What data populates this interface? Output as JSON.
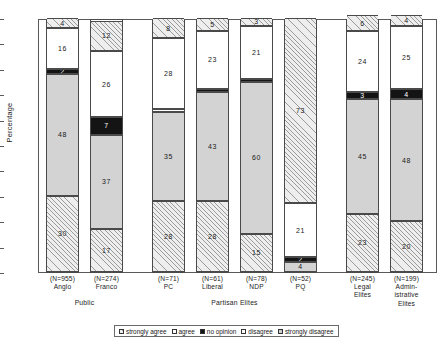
{
  "chart_data": {
    "type": "bar",
    "subtype": "stacked-bar-100-percent",
    "title": "",
    "xlabel": "",
    "ylabel": "Percentage",
    "ylim": [
      0,
      100
    ],
    "yticks": [
      0,
      10,
      20,
      30,
      40,
      50,
      60,
      70,
      80,
      90,
      100
    ],
    "grid": false,
    "legend_position": "bottom",
    "legend": [
      {
        "label": "strongly agree",
        "pattern": "hatch"
      },
      {
        "label": "agree",
        "pattern": "white"
      },
      {
        "label": "no opinion",
        "pattern": "black"
      },
      {
        "label": "disagree",
        "pattern": "white"
      },
      {
        "label": "strongly disagree",
        "pattern": "hatch-gray"
      }
    ],
    "categories": [
      "(N=955) Anglo",
      "(N=274) Franco",
      "(N=71) PC",
      "(N=61) Liberal",
      "(N=78) NDP",
      "(N=52) PQ",
      "(N=245) Legal Elites",
      "(N=199) Administrative Elites"
    ],
    "series": [
      {
        "name": "strongly agree",
        "values": [
          30,
          17,
          28,
          28,
          15,
          4,
          23,
          20
        ]
      },
      {
        "name": "agree",
        "values": [
          48,
          37,
          35,
          43,
          60,
          2,
          45,
          48
        ]
      },
      {
        "name": "no opinion",
        "values": [
          2,
          7,
          0,
          1,
          1,
          21,
          3,
          4
        ]
      },
      {
        "name": "disagree",
        "values": [
          16,
          26,
          28,
          23,
          21,
          73,
          24,
          25
        ]
      },
      {
        "name": "strongly disagree",
        "values": [
          4,
          12,
          8,
          5,
          3,
          0,
          6,
          4
        ]
      }
    ],
    "bars": [
      {
        "key": "anglo",
        "n_label": "(N=955)",
        "name_lines": [
          "Anglo"
        ],
        "segments": [
          {
            "label": "30",
            "value": 30,
            "pattern": "hatch"
          },
          {
            "label": "48",
            "value": 48,
            "pattern": "gray"
          },
          {
            "label": "2",
            "value": 2,
            "pattern": "black"
          },
          {
            "label": "16",
            "value": 16,
            "pattern": "white"
          },
          {
            "label": "4",
            "value": 4,
            "pattern": "hatch"
          }
        ]
      },
      {
        "key": "franco",
        "n_label": "(N=274)",
        "name_lines": [
          "Franco"
        ],
        "segments": [
          {
            "label": "17",
            "value": 17,
            "pattern": "hatch"
          },
          {
            "label": "37",
            "value": 37,
            "pattern": "gray"
          },
          {
            "label": "7",
            "value": 7,
            "pattern": "black"
          },
          {
            "label": "26",
            "value": 26,
            "pattern": "white"
          },
          {
            "label": "12",
            "value": 12,
            "pattern": "hatch"
          }
        ]
      },
      {
        "key": "pc",
        "n_label": "(N=71)",
        "name_lines": [
          "PC"
        ],
        "segments": [
          {
            "label": "28",
            "value": 28,
            "pattern": "hatch"
          },
          {
            "label": "35",
            "value": 35,
            "pattern": "gray"
          },
          {
            "label": "",
            "value": 1,
            "pattern": "white"
          },
          {
            "label": "28",
            "value": 28,
            "pattern": "white"
          },
          {
            "label": "8",
            "value": 8,
            "pattern": "hatch"
          }
        ]
      },
      {
        "key": "liberal",
        "n_label": "(N=61)",
        "name_lines": [
          "Liberal"
        ],
        "segments": [
          {
            "label": "28",
            "value": 28,
            "pattern": "hatch"
          },
          {
            "label": "43",
            "value": 43,
            "pattern": "gray"
          },
          {
            "label": "",
            "value": 1,
            "pattern": "black"
          },
          {
            "label": "23",
            "value": 23,
            "pattern": "white"
          },
          {
            "label": "5",
            "value": 5,
            "pattern": "hatch"
          }
        ]
      },
      {
        "key": "ndp",
        "n_label": "(N=78)",
        "name_lines": [
          "NDP"
        ],
        "segments": [
          {
            "label": "15",
            "value": 15,
            "pattern": "hatch"
          },
          {
            "label": "60",
            "value": 60,
            "pattern": "gray"
          },
          {
            "label": "",
            "value": 1,
            "pattern": "black"
          },
          {
            "label": "21",
            "value": 21,
            "pattern": "white"
          },
          {
            "label": "3",
            "value": 3,
            "pattern": "hatch"
          }
        ]
      },
      {
        "key": "pq",
        "n_label": "(N=52)",
        "name_lines": [
          "PQ"
        ],
        "segments": [
          {
            "label": "4",
            "value": 4,
            "pattern": "gray"
          },
          {
            "label": "2",
            "value": 2,
            "pattern": "black"
          },
          {
            "label": "21",
            "value": 21,
            "pattern": "white"
          },
          {
            "label": "73",
            "value": 73,
            "pattern": "hatch"
          }
        ]
      },
      {
        "key": "legal-elites",
        "n_label": "(N=245)",
        "name_lines": [
          "Legal",
          "Elites"
        ],
        "segments": [
          {
            "label": "23",
            "value": 23,
            "pattern": "hatch"
          },
          {
            "label": "45",
            "value": 45,
            "pattern": "gray"
          },
          {
            "label": "3",
            "value": 3,
            "pattern": "black"
          },
          {
            "label": "24",
            "value": 24,
            "pattern": "white"
          },
          {
            "label": "6",
            "value": 6,
            "pattern": "hatch"
          }
        ]
      },
      {
        "key": "administrative-elites",
        "n_label": "(N=199)",
        "name_lines": [
          "Admin-",
          "istrative",
          "Elites"
        ],
        "segments": [
          {
            "label": "20",
            "value": 20,
            "pattern": "hatch"
          },
          {
            "label": "48",
            "value": 48,
            "pattern": "gray"
          },
          {
            "label": "4",
            "value": 4,
            "pattern": "black"
          },
          {
            "label": "25",
            "value": 25,
            "pattern": "white"
          },
          {
            "label": "4",
            "value": 4,
            "pattern": "hatch"
          }
        ]
      }
    ],
    "group_labels": [
      {
        "label": "Public",
        "span": [
          0,
          1
        ]
      },
      {
        "label": "Partisan Elites",
        "span": [
          2,
          5
        ]
      }
    ]
  },
  "colors": {
    "hatch_fill": "#eeeeee",
    "hatch_line": "#9a9a9a",
    "gray_fill": "#d3d3d3",
    "black_fill": "#141414",
    "white_fill": "#ffffff",
    "axis": "#5a5a5a",
    "text": "#1a1a1a"
  }
}
